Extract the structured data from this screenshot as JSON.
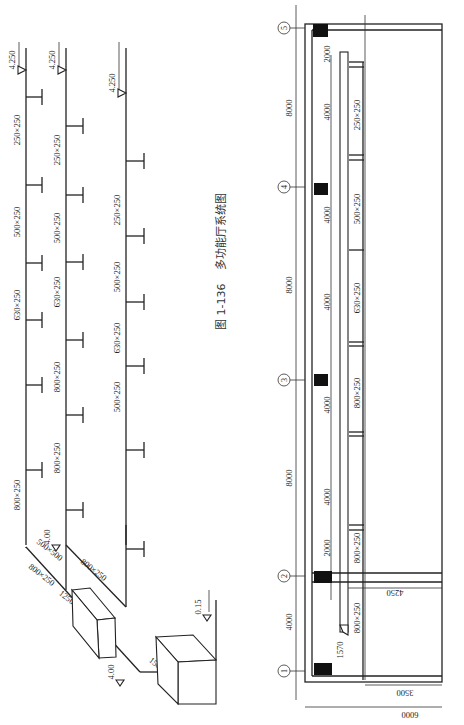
{
  "figure": {
    "caption_number": "图 1-136",
    "caption_title": "多功能厅系统图",
    "orientation": "rotated 90° counter-clockwise"
  },
  "system_diagram": {
    "branches": [
      {
        "id": "branch-1",
        "x": 26,
        "elevation_label": "4.250",
        "elevation_y": 70,
        "segments": [
          {
            "label": "250×250",
            "y": 130
          },
          {
            "label": "500×250",
            "y": 222
          },
          {
            "label": "630×250",
            "y": 305
          },
          {
            "label": "800×250",
            "y": 495
          }
        ],
        "terminals_y": [
          97,
          185,
          263,
          320,
          385,
          470
        ],
        "terminal_len": 16
      },
      {
        "id": "branch-2",
        "x": 66,
        "elevation_label": "4.250",
        "elevation_y": 70,
        "segments": [
          {
            "label": "250×250",
            "y": 150
          },
          {
            "label": "500×250",
            "y": 228
          },
          {
            "label": "630×250",
            "y": 292
          },
          {
            "label": "800×250",
            "y": 377
          },
          {
            "label": "800×250",
            "y": 458
          }
        ],
        "terminals_y": [
          126,
          195,
          262,
          340,
          415,
          510
        ],
        "terminal_len": 17
      },
      {
        "id": "branch-3",
        "x": 126,
        "elevation_label": "4.250",
        "elevation_y": 93,
        "segments": [
          {
            "label": "250×250",
            "y": 210
          },
          {
            "label": "500×250",
            "y": 277
          },
          {
            "label": "630×250",
            "y": 338
          },
          {
            "label": "500×250",
            "y": 397
          }
        ],
        "terminals_y": [
          161,
          236,
          302,
          366,
          450,
          549
        ],
        "terminal_len": 18
      }
    ],
    "main_duct_labels": [
      {
        "label": "800×250",
        "x": 40,
        "y": 577,
        "angle": 38
      },
      {
        "label": "500×500",
        "x": 48,
        "y": 552,
        "angle": 38
      },
      {
        "label": "800×250",
        "x": 92,
        "y": 572,
        "angle": 38
      },
      {
        "label": "1250×500",
        "x": 72,
        "y": 605,
        "angle": 38
      },
      {
        "label": "1500×500",
        "x": 162,
        "y": 672,
        "angle": 38
      }
    ],
    "elevation_marks": [
      {
        "label": "4.00",
        "x": 56,
        "y": 545
      },
      {
        "label": "4.00",
        "x": 120,
        "y": 680
      },
      {
        "label": "0.15",
        "x": 207,
        "y": 615
      }
    ],
    "equipment": [
      {
        "name": "silencer-box",
        "label": "1250×500"
      },
      {
        "name": "air-handling-unit",
        "label": "1500×500"
      }
    ]
  },
  "floor_plan": {
    "axes": [
      {
        "label": "5",
        "y": 28
      },
      {
        "label": "4",
        "y": 187
      },
      {
        "label": "3",
        "y": 380
      },
      {
        "label": "2",
        "y": 576
      },
      {
        "label": "1",
        "y": 671
      }
    ],
    "axis_dimensions": [
      {
        "label": "8000",
        "y": 108
      },
      {
        "label": "8000",
        "y": 285
      },
      {
        "label": "8000",
        "y": 478
      },
      {
        "label": "4000",
        "y": 622
      }
    ],
    "sub_dimensions": [
      {
        "label": "2000",
        "y": 54
      },
      {
        "label": "4000",
        "y": 112
      },
      {
        "label": "4000",
        "y": 215
      },
      {
        "label": "4000",
        "y": 302
      },
      {
        "label": "4000",
        "y": 405
      },
      {
        "label": "4000",
        "y": 497
      },
      {
        "label": "2000",
        "y": 548
      }
    ],
    "duct_labels": [
      {
        "label": "250×250",
        "y": 115
      },
      {
        "label": "500×250",
        "y": 209
      },
      {
        "label": "630×250",
        "y": 298
      },
      {
        "label": "800×250",
        "y": 393
      },
      {
        "label": "800×250",
        "y": 548
      },
      {
        "label": "800×250",
        "y": 618
      }
    ],
    "other_dimensions": [
      {
        "label": "4250",
        "x": 395,
        "y": 590
      },
      {
        "label": "1570",
        "x": 343,
        "y": 650
      },
      {
        "label": "3500",
        "x": 405,
        "y": 690
      },
      {
        "label": "6000",
        "x": 410,
        "y": 712
      }
    ]
  }
}
